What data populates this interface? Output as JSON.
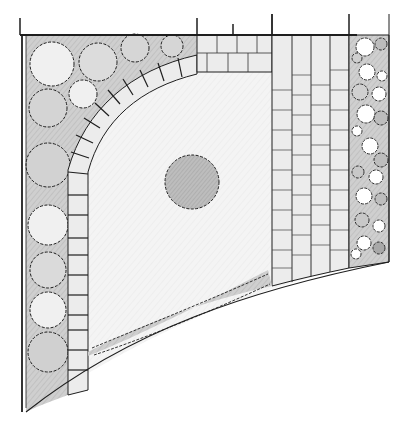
{
  "drawing": {
    "title": "Garden plan sketch",
    "style": "hand-drawn pencil",
    "colors": {
      "paper": "#ffffff",
      "ink": "#1e1e1e",
      "light_fill": "#f2f2f2",
      "planting_fill": "#cfcfcf",
      "tree_fill": "#c4c4c4",
      "paving_fill": "#ececec"
    }
  },
  "elements": {
    "boundary_wall": {
      "label": "Boundary wall"
    },
    "left_border": {
      "label": "Left shrub border",
      "shrub_count": 12
    },
    "right_border": {
      "label": "Right planting strip",
      "plant_count": 22
    },
    "stepping_arc": {
      "label": "Curved stepping-stone path",
      "stone_count": 16
    },
    "lawn": {
      "label": "Lawn"
    },
    "central_tree": {
      "label": "Specimen tree"
    },
    "paving": {
      "label": "Paved path",
      "columns": 4
    },
    "top_paving": {
      "label": "Paved band"
    },
    "bottom_hedge": {
      "label": "Low hedge"
    }
  }
}
